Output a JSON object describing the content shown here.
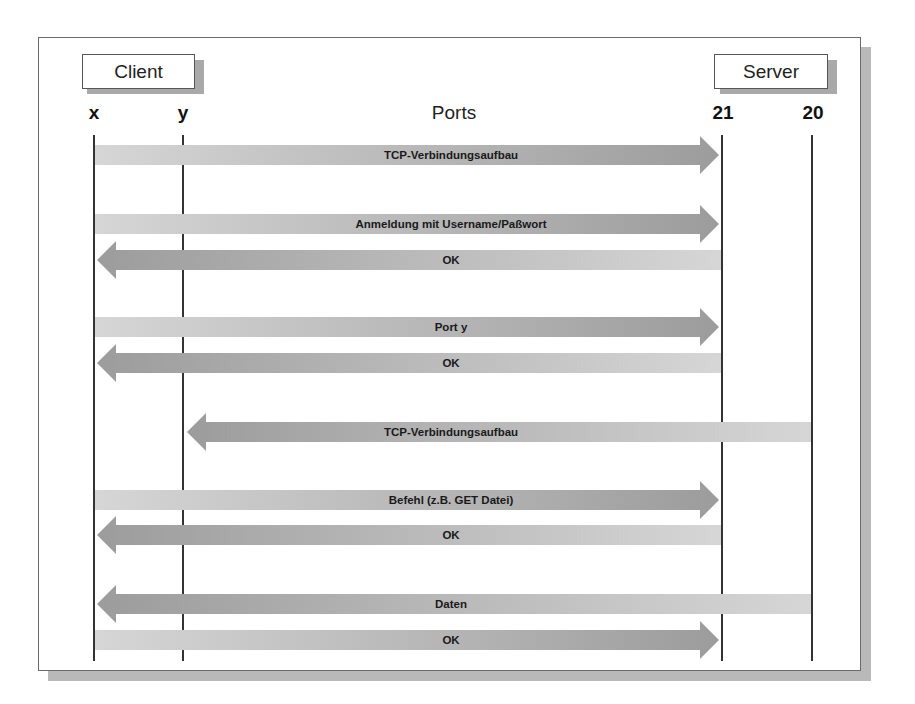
{
  "diagram": {
    "endpoints": {
      "client": "Client",
      "server": "Server"
    },
    "ports_title": "Ports",
    "ports": [
      {
        "id": "x",
        "label": "x",
        "side": "client"
      },
      {
        "id": "y",
        "label": "y",
        "side": "client"
      },
      {
        "id": "21",
        "label": "21",
        "side": "server"
      },
      {
        "id": "20",
        "label": "20",
        "side": "server"
      }
    ],
    "messages": [
      {
        "label": "TCP-Verbindungsaufbau",
        "from": "x",
        "to": "21"
      },
      {
        "label": "Anmeldung mit Username/Paßwort",
        "from": "x",
        "to": "21"
      },
      {
        "label": "OK",
        "from": "21",
        "to": "x"
      },
      {
        "label": "Port y",
        "from": "x",
        "to": "21"
      },
      {
        "label": "OK",
        "from": "21",
        "to": "x"
      },
      {
        "label": "TCP-Verbindungsaufbau",
        "from": "20",
        "to": "y"
      },
      {
        "label": "Befehl (z.B. GET Datei)",
        "from": "x",
        "to": "21"
      },
      {
        "label": "OK",
        "from": "21",
        "to": "x"
      },
      {
        "label": "Daten",
        "from": "20",
        "to": "x"
      },
      {
        "label": "OK",
        "from": "x",
        "to": "21"
      }
    ],
    "colors": {
      "arrow_light": "#d4d4d4",
      "arrow_dark": "#9e9e9e",
      "lifeline": "#333333",
      "frame_shadow": "#b9b9b9"
    }
  }
}
